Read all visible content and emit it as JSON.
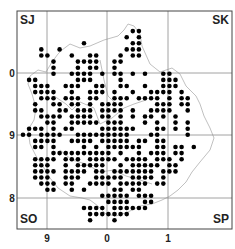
{
  "map": {
    "corner_labels": {
      "top_left": "SJ",
      "top_right": "SK",
      "bottom_left": "SO",
      "bottom_right": "SP"
    },
    "x_ticks": [
      {
        "label": "9",
        "x": 47
      },
      {
        "label": "0",
        "x": 107
      },
      {
        "label": "1",
        "x": 168
      }
    ],
    "y_ticks": [
      {
        "label": "0",
        "y": 73
      },
      {
        "label": "9",
        "y": 135
      },
      {
        "label": "8",
        "y": 198
      }
    ],
    "frame": {
      "left": 17,
      "top": 11,
      "right": 232,
      "bottom": 229
    },
    "colors": {
      "dot": "#000000",
      "grid": "#8a8a8a",
      "frame": "#444444",
      "boundary": "#b0b0b0"
    },
    "dot_grid": {
      "origin_x": 23,
      "origin_y": 25,
      "step": 6.1,
      "radius": 2.3,
      "rows": [
        "...........................",
        "..................##.......",
        ".................#.#.......",
        "..........#.......##.......",
        "...#..#..........###.......",
        "...##...#..##...#.##.......",
        ".....#...####..##..........",
        ".....#...#.##..#...........",
        ".....#..####.#.##.#.#..##..",
        ".##......###....#......###..",
        "..###..###..##..##..#..###..",
        "..####..#..###.#..#..####.#.",
        "...###.###.##..###.####.#.##",
        "..#..##.##.#.####.....###.##",
        "..##..##.###.####.#..####..#",
        "...####.####.##.#.#.##.#.#..",
        "....##..#####.###...#.#..#.#",
        ".###.#.##....######...##.#.#",
        "##.####..#########...##....#",
        "..####..####.#####.##.##.....",
        "..##.#....#.#.######..##.##.#",
        ".....##########.#..#.###.##.",
        "..####.###.#####.####.###.#.",
        "..###..#.#####..#.#####.##..",
        "..####.####.##.#######.###..",
        "..###..###..#####.####.#....",
        "...###.##..####.#####.##....",
        "....##..#.#....##.##........",
        ".............#####.###......",
        "..............####..##......",
        "..........####.######.......",
        "...........#######..........",
        "...........#...#............",
        "............................"
      ]
    }
  }
}
